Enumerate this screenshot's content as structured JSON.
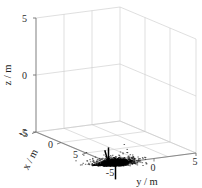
{
  "chart_data": {
    "type": "scatter",
    "title": "",
    "projection": "3d",
    "xlabel": "x / m",
    "ylabel": "y / m",
    "zlabel": "z / m",
    "xticks": [
      -5,
      0,
      5
    ],
    "yticks": [
      -5,
      0,
      5
    ],
    "zticks": [
      -5,
      0,
      5
    ],
    "xticklabels": [
      "-5",
      "0",
      "5"
    ],
    "yticklabels": [
      "-5",
      "0",
      "5"
    ],
    "zticklabels": [
      "5",
      "0",
      "-5"
    ],
    "xlim": [
      -7,
      7
    ],
    "ylim": [
      -7,
      7
    ],
    "zlim": [
      -7,
      7
    ],
    "grid": true,
    "legend": null,
    "marker_color": "#000000",
    "grid_color": "#c9c9c9",
    "axis_color": "#8a8a8a",
    "background": "#ffffff",
    "point_count": 2400,
    "cluster": {
      "center": [
        0,
        0,
        0
      ],
      "wing_span": 9.0,
      "fuselage_length": 5.0,
      "body_thickness": 1.2
    }
  },
  "axes": {
    "z_label": "z / m",
    "y_label": "y / m",
    "x_label": "x / m",
    "z_tick_top": "5",
    "z_tick_mid": "0",
    "z_tick_bot": "-5",
    "y_tick_neg": "-5",
    "y_tick_zero": "0",
    "y_tick_pos": "5",
    "x_tick_neg": "-5",
    "x_tick_zero": "0",
    "x_tick_pos": "5"
  }
}
